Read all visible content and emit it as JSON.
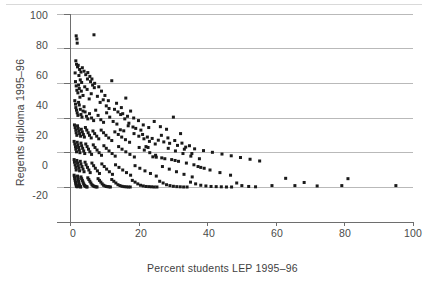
{
  "figure": {
    "name": "scatter-plot-regents-vs-lep",
    "background_color": "#ffffff",
    "marker_color": "#1a1a1a",
    "grid_color": "#b9b9b9",
    "axis_color": "#6e6e6e",
    "top_rule_color": "#d9d9d9"
  },
  "chart_data": {
    "type": "scatter",
    "title": "",
    "xlabel": "Percent students LEP 1995–96",
    "ylabel": "Regents diploma 1995–96",
    "xlim": [
      -4,
      100
    ],
    "ylim": [
      -20,
      100
    ],
    "xticks": [
      0,
      20,
      40,
      60,
      80,
      100
    ],
    "xtick_labels": [
      "0",
      "20",
      "40",
      "60",
      "80",
      "100"
    ],
    "yticks": [
      -20,
      0,
      20,
      40,
      60,
      80,
      100
    ],
    "ytick_labels": [
      "-20",
      "0",
      "20",
      "40",
      "60",
      "80",
      "100"
    ],
    "grid": "horizontal",
    "gridlines_y": [
      0,
      20,
      40,
      60,
      80,
      100
    ],
    "legend": "none",
    "marker": "square",
    "marker_size_px": 3,
    "n_points": 486,
    "points": [
      [
        1.6,
        87.4
      ],
      [
        1.8,
        85.6
      ],
      [
        1.9,
        83.2
      ],
      [
        6.8,
        88.0
      ],
      [
        1.5,
        73.0
      ],
      [
        1.7,
        71.0
      ],
      [
        2.0,
        69.5
      ],
      [
        2.2,
        70.4
      ],
      [
        2.6,
        68.0
      ],
      [
        3.0,
        66.5
      ],
      [
        3.4,
        69.0
      ],
      [
        3.9,
        67.0
      ],
      [
        4.4,
        65.0
      ],
      [
        5.0,
        66.2
      ],
      [
        5.6,
        64.0
      ],
      [
        6.2,
        62.5
      ],
      [
        2.4,
        64.5
      ],
      [
        2.8,
        62.0
      ],
      [
        3.2,
        60.5
      ],
      [
        1.3,
        66.0
      ],
      [
        1.4,
        61.0
      ],
      [
        1.6,
        58.5
      ],
      [
        1.8,
        56.0
      ],
      [
        2.1,
        54.5
      ],
      [
        2.3,
        59.0
      ],
      [
        2.5,
        57.0
      ],
      [
        2.7,
        52.0
      ],
      [
        3.1,
        55.5
      ],
      [
        3.6,
        53.0
      ],
      [
        4.1,
        58.0
      ],
      [
        4.8,
        56.5
      ],
      [
        5.4,
        51.0
      ],
      [
        6.0,
        54.0
      ],
      [
        6.9,
        57.5
      ],
      [
        7.8,
        52.5
      ],
      [
        8.6,
        49.0
      ],
      [
        9.5,
        50.5
      ],
      [
        10.4,
        47.0
      ],
      [
        11.2,
        45.5
      ],
      [
        12.0,
        61.5
      ],
      [
        13.4,
        48.5
      ],
      [
        14.8,
        46.0
      ],
      [
        16.1,
        51.5
      ],
      [
        17.5,
        44.0
      ],
      [
        1.2,
        50.0
      ],
      [
        1.4,
        48.0
      ],
      [
        1.5,
        46.0
      ],
      [
        1.7,
        44.5
      ],
      [
        1.9,
        43.0
      ],
      [
        2.1,
        41.5
      ],
      [
        2.3,
        49.0
      ],
      [
        2.5,
        47.5
      ],
      [
        2.8,
        45.0
      ],
      [
        3.0,
        42.0
      ],
      [
        3.3,
        40.5
      ],
      [
        3.6,
        44.0
      ],
      [
        3.9,
        46.5
      ],
      [
        4.2,
        43.5
      ],
      [
        4.6,
        41.0
      ],
      [
        5.0,
        39.5
      ],
      [
        5.5,
        42.5
      ],
      [
        6.1,
        40.0
      ],
      [
        6.7,
        38.5
      ],
      [
        7.3,
        44.5
      ],
      [
        8.0,
        41.5
      ],
      [
        8.8,
        39.0
      ],
      [
        9.6,
        37.5
      ],
      [
        10.5,
        43.0
      ],
      [
        11.4,
        40.5
      ],
      [
        12.4,
        38.0
      ],
      [
        13.5,
        36.5
      ],
      [
        14.6,
        42.0
      ],
      [
        15.8,
        39.5
      ],
      [
        17.0,
        37.0
      ],
      [
        18.4,
        40.0
      ],
      [
        19.8,
        38.5
      ],
      [
        21.2,
        36.0
      ],
      [
        22.8,
        34.5
      ],
      [
        24.4,
        38.0
      ],
      [
        26.2,
        35.0
      ],
      [
        28.0,
        33.5
      ],
      [
        30.0,
        40.5
      ],
      [
        32.1,
        31.0
      ],
      [
        1.1,
        36.0
      ],
      [
        1.3,
        34.5
      ],
      [
        1.5,
        33.0
      ],
      [
        1.6,
        31.5
      ],
      [
        1.8,
        30.0
      ],
      [
        2.0,
        35.5
      ],
      [
        2.2,
        34.0
      ],
      [
        2.4,
        32.5
      ],
      [
        2.6,
        31.0
      ],
      [
        2.9,
        29.5
      ],
      [
        3.1,
        33.5
      ],
      [
        3.4,
        32.0
      ],
      [
        3.7,
        30.5
      ],
      [
        4.0,
        29.0
      ],
      [
        4.3,
        34.5
      ],
      [
        4.7,
        33.0
      ],
      [
        5.1,
        31.5
      ],
      [
        5.5,
        30.0
      ],
      [
        6.0,
        28.5
      ],
      [
        6.5,
        32.5
      ],
      [
        7.0,
        31.0
      ],
      [
        7.6,
        29.5
      ],
      [
        8.2,
        28.0
      ],
      [
        8.9,
        33.0
      ],
      [
        9.6,
        31.5
      ],
      [
        10.3,
        30.0
      ],
      [
        11.1,
        28.5
      ],
      [
        12.0,
        27.0
      ],
      [
        12.9,
        32.0
      ],
      [
        13.9,
        30.5
      ],
      [
        14.9,
        29.0
      ],
      [
        16.0,
        27.5
      ],
      [
        17.2,
        26.0
      ],
      [
        18.5,
        31.0
      ],
      [
        19.9,
        29.5
      ],
      [
        21.4,
        28.0
      ],
      [
        23.0,
        26.5
      ],
      [
        24.7,
        25.0
      ],
      [
        26.5,
        30.0
      ],
      [
        28.4,
        28.5
      ],
      [
        30.4,
        27.0
      ],
      [
        32.5,
        25.5
      ],
      [
        34.7,
        24.0
      ],
      [
        1.0,
        26.5
      ],
      [
        1.2,
        25.0
      ],
      [
        1.4,
        23.5
      ],
      [
        1.5,
        22.0
      ],
      [
        1.7,
        20.5
      ],
      [
        1.9,
        26.0
      ],
      [
        2.1,
        24.5
      ],
      [
        2.3,
        23.0
      ],
      [
        2.5,
        21.5
      ],
      [
        2.7,
        20.0
      ],
      [
        3.0,
        25.5
      ],
      [
        3.2,
        24.0
      ],
      [
        3.5,
        22.5
      ],
      [
        3.8,
        21.0
      ],
      [
        4.1,
        19.5
      ],
      [
        4.4,
        25.0
      ],
      [
        4.8,
        23.5
      ],
      [
        5.2,
        22.0
      ],
      [
        5.6,
        20.5
      ],
      [
        6.1,
        19.0
      ],
      [
        6.6,
        24.5
      ],
      [
        7.1,
        23.0
      ],
      [
        7.7,
        21.5
      ],
      [
        8.3,
        20.0
      ],
      [
        9.0,
        18.5
      ],
      [
        9.7,
        24.0
      ],
      [
        10.4,
        22.5
      ],
      [
        11.2,
        21.0
      ],
      [
        12.1,
        19.5
      ],
      [
        13.0,
        18.0
      ],
      [
        14.0,
        23.5
      ],
      [
        15.0,
        22.0
      ],
      [
        16.1,
        20.5
      ],
      [
        17.3,
        19.0
      ],
      [
        18.6,
        17.5
      ],
      [
        20.0,
        23.0
      ],
      [
        21.5,
        21.5
      ],
      [
        23.1,
        20.0
      ],
      [
        24.8,
        18.5
      ],
      [
        26.6,
        17.0
      ],
      [
        28.5,
        22.5
      ],
      [
        30.6,
        21.0
      ],
      [
        32.8,
        19.5
      ],
      [
        35.1,
        18.0
      ],
      [
        37.6,
        16.5
      ],
      [
        22.0,
        23.5
      ],
      [
        22.6,
        23.0
      ],
      [
        33.2,
        22.0
      ],
      [
        35.4,
        19.5
      ],
      [
        1.0,
        16.0
      ],
      [
        1.1,
        14.5
      ],
      [
        1.3,
        13.0
      ],
      [
        1.5,
        11.5
      ],
      [
        1.6,
        10.0
      ],
      [
        1.8,
        15.5
      ],
      [
        2.0,
        14.0
      ],
      [
        2.2,
        12.5
      ],
      [
        2.4,
        11.0
      ],
      [
        2.6,
        9.5
      ],
      [
        2.8,
        15.0
      ],
      [
        3.0,
        13.5
      ],
      [
        3.3,
        12.0
      ],
      [
        3.6,
        10.5
      ],
      [
        3.9,
        9.0
      ],
      [
        4.2,
        14.5
      ],
      [
        4.5,
        13.0
      ],
      [
        4.9,
        11.5
      ],
      [
        5.3,
        10.0
      ],
      [
        5.7,
        8.5
      ],
      [
        6.2,
        14.0
      ],
      [
        6.7,
        12.5
      ],
      [
        7.2,
        11.0
      ],
      [
        7.8,
        9.5
      ],
      [
        8.4,
        8.0
      ],
      [
        9.1,
        13.5
      ],
      [
        9.8,
        12.0
      ],
      [
        10.5,
        10.5
      ],
      [
        11.3,
        9.0
      ],
      [
        12.2,
        7.5
      ],
      [
        13.1,
        13.0
      ],
      [
        14.1,
        11.5
      ],
      [
        15.2,
        10.0
      ],
      [
        16.3,
        8.5
      ],
      [
        17.5,
        7.0
      ],
      [
        18.8,
        12.5
      ],
      [
        20.2,
        11.0
      ],
      [
        21.7,
        9.5
      ],
      [
        23.3,
        8.0
      ],
      [
        25.0,
        6.5
      ],
      [
        26.8,
        12.0
      ],
      [
        28.8,
        10.5
      ],
      [
        30.9,
        9.0
      ],
      [
        33.1,
        7.5
      ],
      [
        35.5,
        6.0
      ],
      [
        38.0,
        11.5
      ],
      [
        40.7,
        10.0
      ],
      [
        43.6,
        8.5
      ],
      [
        46.7,
        7.0
      ],
      [
        1.0,
        7.0
      ],
      [
        1.1,
        6.0
      ],
      [
        1.2,
        5.0
      ],
      [
        1.3,
        4.0
      ],
      [
        1.4,
        3.0
      ],
      [
        1.5,
        2.0
      ],
      [
        1.6,
        1.2
      ],
      [
        1.7,
        0.8
      ],
      [
        1.8,
        0.5
      ],
      [
        1.9,
        0.3
      ],
      [
        2.0,
        6.5
      ],
      [
        2.1,
        5.5
      ],
      [
        2.2,
        4.5
      ],
      [
        2.3,
        3.5
      ],
      [
        2.4,
        2.5
      ],
      [
        2.5,
        1.5
      ],
      [
        2.6,
        1.0
      ],
      [
        2.7,
        0.6
      ],
      [
        2.8,
        0.4
      ],
      [
        2.9,
        0.2
      ],
      [
        3.0,
        6.0
      ],
      [
        3.2,
        5.0
      ],
      [
        3.4,
        4.0
      ],
      [
        3.6,
        3.0
      ],
      [
        3.8,
        2.0
      ],
      [
        4.0,
        1.2
      ],
      [
        4.2,
        0.8
      ],
      [
        4.4,
        0.5
      ],
      [
        4.6,
        0.3
      ],
      [
        4.8,
        0.2
      ],
      [
        5.0,
        5.5
      ],
      [
        5.3,
        4.5
      ],
      [
        5.6,
        3.5
      ],
      [
        5.9,
        2.5
      ],
      [
        6.2,
        1.5
      ],
      [
        6.5,
        1.0
      ],
      [
        6.8,
        0.6
      ],
      [
        7.1,
        0.4
      ],
      [
        7.4,
        0.3
      ],
      [
        7.7,
        0.2
      ],
      [
        8.0,
        5.0
      ],
      [
        8.4,
        4.0
      ],
      [
        8.8,
        3.0
      ],
      [
        9.2,
        2.0
      ],
      [
        9.6,
        1.2
      ],
      [
        10.0,
        0.8
      ],
      [
        10.4,
        0.5
      ],
      [
        10.8,
        0.4
      ],
      [
        11.2,
        0.3
      ],
      [
        11.6,
        0.2
      ],
      [
        12.0,
        4.5
      ],
      [
        12.6,
        3.5
      ],
      [
        13.2,
        2.5
      ],
      [
        13.8,
        1.5
      ],
      [
        14.4,
        1.0
      ],
      [
        15.0,
        0.6
      ],
      [
        15.6,
        0.4
      ],
      [
        16.2,
        0.3
      ],
      [
        16.8,
        0.2
      ],
      [
        17.4,
        0.2
      ],
      [
        18.0,
        4.0
      ],
      [
        18.8,
        3.0
      ],
      [
        19.6,
        2.0
      ],
      [
        20.4,
        1.2
      ],
      [
        21.2,
        0.8
      ],
      [
        22.0,
        0.5
      ],
      [
        22.8,
        0.4
      ],
      [
        23.6,
        0.3
      ],
      [
        24.4,
        0.2
      ],
      [
        25.2,
        0.2
      ],
      [
        26.0,
        3.5
      ],
      [
        27.0,
        2.5
      ],
      [
        28.0,
        1.5
      ],
      [
        29.0,
        1.0
      ],
      [
        30.0,
        0.6
      ],
      [
        31.0,
        0.4
      ],
      [
        32.0,
        0.3
      ],
      [
        33.0,
        0.2
      ],
      [
        34.0,
        0.2
      ],
      [
        35.0,
        3.0
      ],
      [
        36.5,
        2.0
      ],
      [
        38.0,
        1.2
      ],
      [
        39.5,
        0.8
      ],
      [
        41.0,
        0.5
      ],
      [
        42.5,
        0.4
      ],
      [
        44.0,
        0.3
      ],
      [
        45.5,
        0.2
      ],
      [
        47.0,
        0.2
      ],
      [
        48.5,
        2.5
      ],
      [
        50.0,
        1.0
      ],
      [
        52.0,
        0.5
      ],
      [
        54.0,
        0.3
      ],
      [
        58.8,
        1.0
      ],
      [
        62.8,
        5.2
      ],
      [
        65.5,
        1.0
      ],
      [
        68.2,
        2.8
      ],
      [
        72.0,
        0.8
      ],
      [
        79.2,
        1.0
      ],
      [
        81.0,
        5.0
      ],
      [
        95.0,
        1.0
      ],
      [
        14.5,
        33.2
      ],
      [
        15.5,
        32.6
      ],
      [
        24.0,
        17.6
      ],
      [
        25.0,
        17.4
      ],
      [
        33.8,
        14.0
      ],
      [
        36.0,
        13.0
      ],
      [
        37.2,
        12.0
      ],
      [
        39.0,
        11.0
      ],
      [
        30.5,
        15.5
      ],
      [
        31.5,
        15.0
      ],
      [
        27.5,
        16.5
      ],
      [
        29.5,
        16.0
      ],
      [
        19.0,
        34.0
      ],
      [
        20.5,
        33.0
      ],
      [
        16.8,
        35.5
      ],
      [
        18.2,
        34.8
      ],
      [
        10.0,
        53.0
      ],
      [
        11.0,
        50.0
      ],
      [
        9.0,
        55.5
      ],
      [
        8.2,
        58.0
      ],
      [
        7.0,
        60.0
      ],
      [
        6.4,
        59.0
      ],
      [
        5.8,
        61.0
      ],
      [
        4.9,
        62.5
      ],
      [
        12.8,
        45.0
      ],
      [
        13.8,
        43.5
      ],
      [
        15.2,
        42.5
      ],
      [
        16.6,
        41.0
      ],
      [
        21.0,
        30.5
      ],
      [
        22.4,
        29.0
      ],
      [
        23.8,
        28.2
      ],
      [
        25.6,
        27.2
      ],
      [
        27.2,
        26.2
      ],
      [
        28.9,
        25.4
      ],
      [
        31.2,
        24.2
      ],
      [
        33.6,
        23.2
      ],
      [
        36.2,
        22.2
      ],
      [
        38.8,
        21.2
      ],
      [
        41.4,
        20.2
      ],
      [
        44.2,
        19.2
      ],
      [
        46.9,
        18.2
      ],
      [
        49.6,
        17.2
      ],
      [
        52.4,
        16.2
      ],
      [
        55.2,
        15.2
      ]
    ]
  },
  "axis_titles": {
    "x": "Percent students LEP 1995–96",
    "y": "Regents diploma 1995–96"
  }
}
